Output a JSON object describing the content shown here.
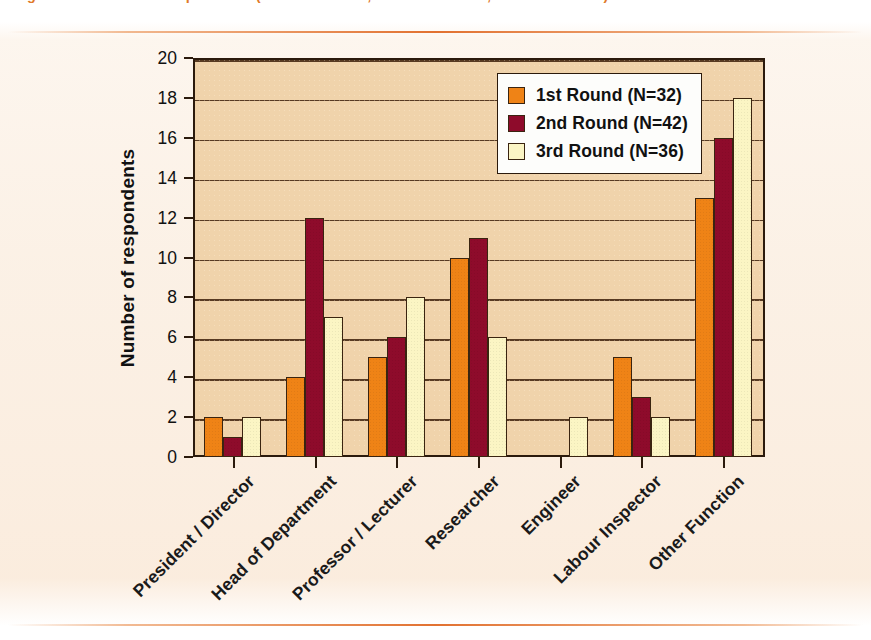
{
  "caption": {
    "text": "Figure 4. Function of respondents (1st round N=32, 2nd round N=42, 3rd round N=36)"
  },
  "chart_data": {
    "type": "bar",
    "title": "",
    "xlabel": "",
    "ylabel": "Number of respondents",
    "ylim": [
      0,
      20
    ],
    "ytick_step": 2,
    "yticks": [
      "0",
      "2",
      "4",
      "6",
      "8",
      "10",
      "12",
      "14",
      "16",
      "18",
      "20"
    ],
    "grid": true,
    "legend_position": "top-right",
    "categories": [
      "President / Director",
      "Head of Department",
      "Professor / Lecturer",
      "Researcher",
      "Engineer",
      "Labour Inspector",
      "Other Function"
    ],
    "series": [
      {
        "name": "1st Round (N=32)",
        "color": "#ef8316",
        "values": [
          2,
          4,
          5,
          10,
          0,
          5,
          13
        ]
      },
      {
        "name": "2nd Round (N=42)",
        "color": "#8e0b2b",
        "values": [
          1,
          12,
          6,
          11,
          0,
          3,
          16
        ]
      },
      {
        "name": "3rd Round (N=36)",
        "color": "#fbf5c4",
        "values": [
          2,
          7,
          8,
          6,
          2,
          2,
          18
        ]
      }
    ]
  },
  "legend": {
    "entries": [
      {
        "label": "1st Round (N=32)",
        "swatch": "#ef8316"
      },
      {
        "label": "2nd Round (N=42)",
        "swatch": "#8e0b2b"
      },
      {
        "label": "3rd Round (N=36)",
        "swatch": "#fbf5c4"
      }
    ]
  },
  "style": {
    "plot_background": "#f0d3ab",
    "axis_color": "#2b1a0c",
    "rule_color": "#e06a26",
    "page_background": "#ffffff"
  }
}
